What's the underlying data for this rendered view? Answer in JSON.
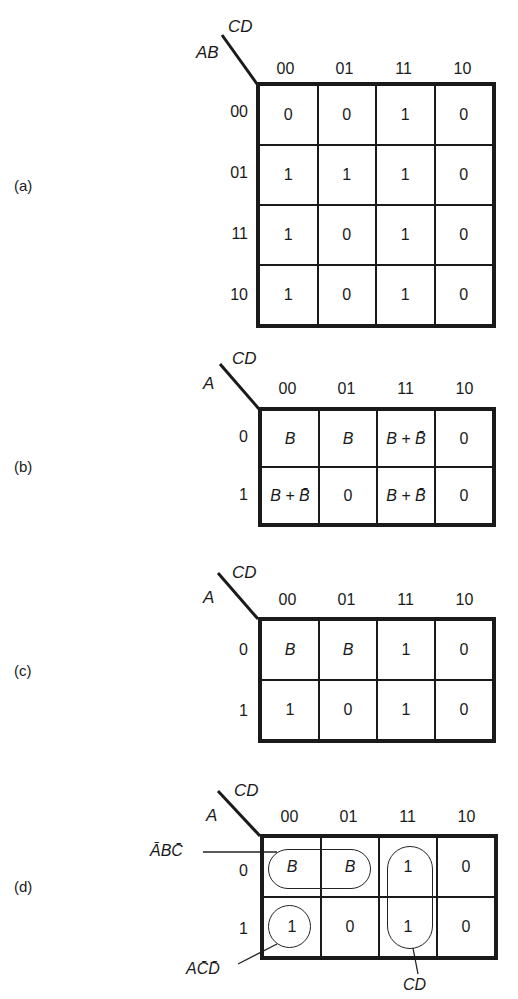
{
  "maps": [
    {
      "label": "(a)",
      "row_var": "AB",
      "col_var": "CD",
      "cols": [
        "00",
        "01",
        "11",
        "10"
      ],
      "rows": [
        "00",
        "01",
        "11",
        "10"
      ],
      "cells": [
        [
          "0",
          "0",
          "1",
          "0"
        ],
        [
          "1",
          "1",
          "1",
          "0"
        ],
        [
          "1",
          "0",
          "1",
          "0"
        ],
        [
          "1",
          "0",
          "1",
          "0"
        ]
      ]
    },
    {
      "label": "(b)",
      "row_var": "A",
      "col_var": "CD",
      "cols": [
        "00",
        "01",
        "11",
        "10"
      ],
      "rows": [
        "0",
        "1"
      ],
      "cells": [
        [
          "B",
          "B",
          "B + B̄",
          "0"
        ],
        [
          "B + B̄",
          "0",
          "B + B̄",
          "0"
        ]
      ]
    },
    {
      "label": "(c)",
      "row_var": "A",
      "col_var": "CD",
      "cols": [
        "00",
        "01",
        "11",
        "10"
      ],
      "rows": [
        "0",
        "1"
      ],
      "cells": [
        [
          "B",
          "B",
          "1",
          "0"
        ],
        [
          "1",
          "0",
          "1",
          "0"
        ]
      ]
    },
    {
      "label": "(d)",
      "row_var": "A",
      "col_var": "CD",
      "cols": [
        "00",
        "01",
        "11",
        "10"
      ],
      "rows": [
        "0",
        "1"
      ],
      "cells": [
        [
          "B",
          "B",
          "1",
          "0"
        ],
        [
          "1",
          "0",
          "1",
          "0"
        ]
      ],
      "groupings": [
        {
          "term": "ĀBC̄",
          "cells": "row 0, cols 00–01"
        },
        {
          "term": "AC̄D̄",
          "cells": "row 1, col 00"
        },
        {
          "term": "CD",
          "cells": "rows 0–1, col 11"
        }
      ]
    }
  ]
}
